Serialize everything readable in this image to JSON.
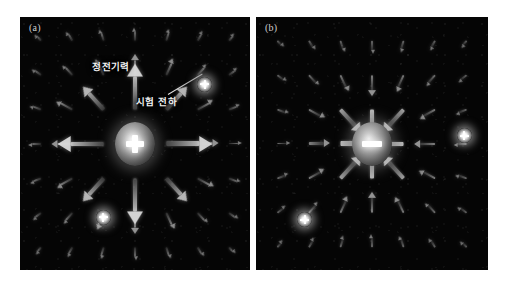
{
  "figure": {
    "caption_a": "(a)",
    "caption_b": "(b)",
    "background": "#050505",
    "page_background": "#ffffff",
    "arrow_color": "#d7d7d7",
    "charge_glow_color": "#ffffff"
  },
  "panels": [
    {
      "id": "panel-a",
      "label": "(a)",
      "center_charge": {
        "polarity": "positive",
        "sign_glyph": "+",
        "field_direction": "outward"
      },
      "annotations": [
        {
          "text": "정전기력",
          "meaning": "electrostatic-force"
        },
        {
          "text": "시험 전하",
          "meaning": "test-charge"
        }
      ],
      "test_charges": [
        {
          "polarity": "positive",
          "sign_glyph": "+",
          "x_pct": 80.4,
          "y_pct": 26.5
        },
        {
          "polarity": "positive",
          "sign_glyph": "+",
          "x_pct": 36.1,
          "y_pct": 79.1
        }
      ]
    },
    {
      "id": "panel-b",
      "label": "(b)",
      "center_charge": {
        "polarity": "negative",
        "sign_glyph": "−",
        "field_direction": "inward"
      },
      "annotations": [],
      "test_charges": [
        {
          "polarity": "positive",
          "sign_glyph": "+",
          "x_pct": 89.7,
          "y_pct": 47.0
        },
        {
          "polarity": "positive",
          "sign_glyph": "+",
          "x_pct": 21.1,
          "y_pct": 80.2
        }
      ]
    }
  ],
  "chart_data": {
    "type": "scatter",
    "xlabel": "",
    "ylabel": "",
    "grid": false,
    "legend": "none",
    "series": [
      {
        "name": "panel-a-outward-field",
        "center": [
          0,
          0
        ],
        "polarity": "positive",
        "direction": "outward",
        "grid_rows": 7,
        "grid_cols": 7,
        "x": [
          -3,
          -2,
          -1,
          0,
          1,
          2,
          3
        ],
        "y": [
          3,
          2,
          1,
          0,
          -1,
          -2,
          -3
        ]
      },
      {
        "name": "panel-b-inward-field",
        "center": [
          0,
          0
        ],
        "polarity": "negative",
        "direction": "inward",
        "grid_rows": 7,
        "grid_cols": 7,
        "x": [
          -3,
          -2,
          -1,
          0,
          1,
          2,
          3
        ],
        "y": [
          3,
          2,
          1,
          0,
          -1,
          -2,
          -3
        ]
      }
    ]
  }
}
